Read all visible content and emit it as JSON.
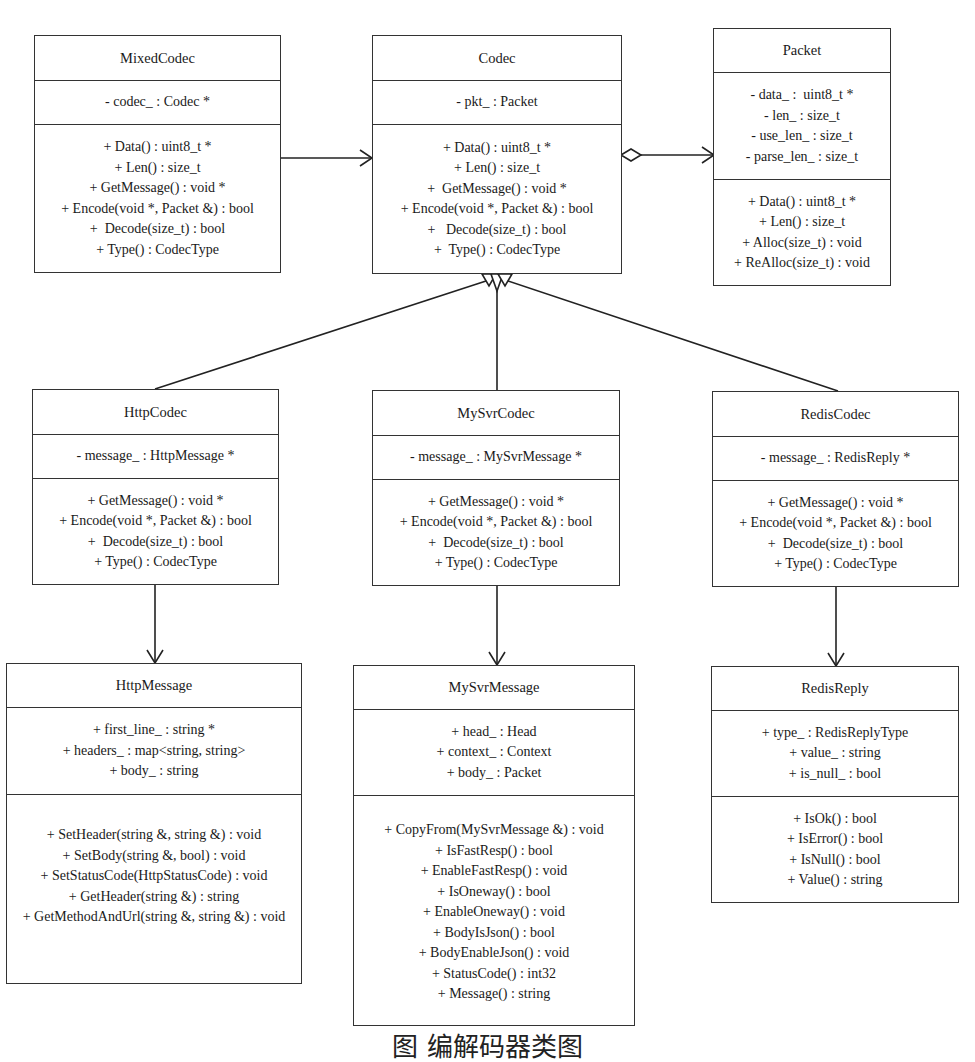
{
  "classes": {
    "mixed_codec": {
      "name": "MixedCodec",
      "attributes": [
        "- codec_ : Codec *"
      ],
      "operations": [
        "+ Data() : uint8_t *",
        "+ Len() : size_t",
        "+ GetMessage() : void *",
        "+ Encode(void *, Packet &) : bool",
        "+  Decode(size_t) : bool",
        "+ Type() : CodecType"
      ]
    },
    "codec": {
      "name": "Codec",
      "attributes": [
        "- pkt_ : Packet"
      ],
      "operations": [
        "+ Data() : uint8_t *",
        "+ Len() : size_t",
        "+  GetMessage() : void *",
        "+ Encode(void *, Packet &) : bool",
        "+   Decode(size_t) : bool",
        "+  Type() : CodecType"
      ]
    },
    "packet": {
      "name": "Packet",
      "attributes": [
        "- data_ :  uint8_t *",
        "- len_ : size_t",
        "- use_len_ : size_t",
        "- parse_len_ : size_t"
      ],
      "operations": [
        "+ Data() : uint8_t *",
        "+ Len() : size_t",
        "+ Alloc(size_t) : void",
        "+ ReAlloc(size_t) : void"
      ]
    },
    "http_codec": {
      "name": "HttpCodec",
      "attributes": [
        "- message_ : HttpMessage *"
      ],
      "operations": [
        "+ GetMessage() : void *",
        "+ Encode(void *, Packet &) : bool",
        "+  Decode(size_t) : bool",
        "+ Type() : CodecType"
      ]
    },
    "mysvr_codec": {
      "name": "MySvrCodec",
      "attributes": [
        "- message_ : MySvrMessage *"
      ],
      "operations": [
        "+ GetMessage() : void *",
        "+ Encode(void *, Packet &) : bool",
        "+  Decode(size_t) : bool",
        "+ Type() : CodecType"
      ]
    },
    "redis_codec": {
      "name": "RedisCodec",
      "attributes": [
        "- message_ : RedisReply *"
      ],
      "operations": [
        "+ GetMessage() : void *",
        "+ Encode(void *, Packet &) : bool",
        "+  Decode(size_t) : bool",
        "+ Type() : CodecType"
      ]
    },
    "http_message": {
      "name": "HttpMessage",
      "attributes": [
        "+ first_line_ : string *",
        "+ headers_ : map<string, string>",
        "+ body_ : string"
      ],
      "operations": [
        "+ SetHeader(string &, string &) : void",
        "+ SetBody(string &, bool) : void",
        "+ SetStatusCode(HttpStatusCode) : void",
        "+ GetHeader(string &) : string",
        "+ GetMethodAndUrl(string &, string &) : void"
      ]
    },
    "mysvr_message": {
      "name": "MySvrMessage",
      "attributes": [
        "+ head_ : Head",
        "+ context_ : Context",
        "+ body_ : Packet"
      ],
      "operations": [
        "+ CopyFrom(MySvrMessage &) : void",
        "+ IsFastResp() : bool",
        "+ EnableFastResp() : void",
        "+ IsOneway() : bool",
        "+ EnableOneway() : void",
        "+ BodyIsJson() : bool",
        "+ BodyEnableJson() : void",
        "+ StatusCode() : int32",
        "+ Message() : string"
      ]
    },
    "redis_reply": {
      "name": "RedisReply",
      "attributes": [
        "+ type_ : RedisReplyType",
        "+ value_ : string",
        "+ is_null_ : bool"
      ],
      "operations": [
        "+ IsOk() : bool",
        "+ IsError() : bool",
        "+ IsNull() : bool",
        "+ Value() : string"
      ]
    }
  },
  "relations": [
    {
      "from": "MixedCodec",
      "to": "Codec",
      "type": "association"
    },
    {
      "from": "Codec",
      "to": "Packet",
      "type": "aggregation"
    },
    {
      "from": "HttpCodec",
      "to": "Codec",
      "type": "generalization"
    },
    {
      "from": "MySvrCodec",
      "to": "Codec",
      "type": "generalization"
    },
    {
      "from": "RedisCodec",
      "to": "Codec",
      "type": "generalization"
    },
    {
      "from": "HttpCodec",
      "to": "HttpMessage",
      "type": "association"
    },
    {
      "from": "MySvrCodec",
      "to": "MySvrMessage",
      "type": "association"
    },
    {
      "from": "RedisCodec",
      "to": "RedisReply",
      "type": "association"
    }
  ],
  "caption": "图 编解码器类图"
}
